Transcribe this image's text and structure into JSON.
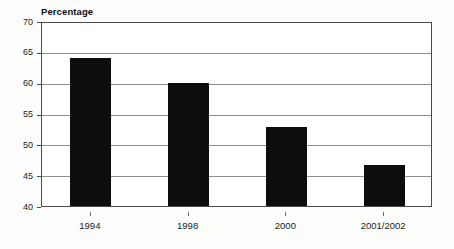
{
  "chart_data": {
    "type": "bar",
    "title": "Percentage",
    "subtitle": "",
    "xlabel": "",
    "ylabel": "Percentage",
    "categories": [
      "1994",
      "1998",
      "2000",
      "2001/2002"
    ],
    "values": [
      64.0,
      59.9,
      52.8,
      46.6
    ],
    "series": [
      {
        "name": "Percentage",
        "values": [
          64.0,
          59.9,
          52.8,
          46.6
        ]
      }
    ],
    "ylim": [
      40,
      70
    ],
    "yticks": [
      40,
      45,
      50,
      55,
      60,
      65,
      70
    ],
    "ytick_labels": [
      "40",
      "45",
      "50",
      "55",
      "60",
      "65",
      "70"
    ],
    "xtick_labels": [
      "1994",
      "1998",
      "2000",
      "2001/2002"
    ],
    "grid": true,
    "grid_axis": "y",
    "legend": false,
    "legend_position": "none",
    "bar_color": "#0d0d0d",
    "grid_color": "#8e8e8e",
    "frame_color": "#4a4a4a",
    "background_color": "#ffffff",
    "annotations": []
  },
  "figure": {
    "title_text": "Percentage",
    "plot_background": "#ffffff",
    "page_background": "#fdfdfc"
  }
}
